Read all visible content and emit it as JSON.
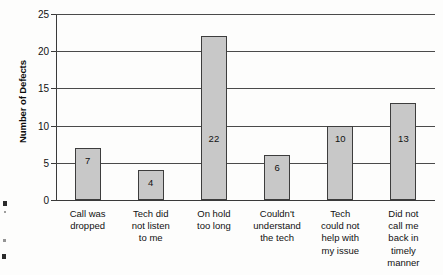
{
  "chart_data": {
    "type": "bar",
    "title": "",
    "subtitle": "",
    "xlabel": "",
    "ylabel": "Number of Defects",
    "ylim": [
      0,
      25
    ],
    "ytick_step": 5,
    "yticks": [
      "0",
      "5",
      "10",
      "15",
      "20",
      "25"
    ],
    "grid": true,
    "legend": false,
    "categories": [
      "Call was dropped",
      "Tech did not listen to me",
      "On hold too long",
      "Couldn't understand the tech",
      "Tech could not help with my issue",
      "Did not call me back in timely manner"
    ],
    "category_lines": [
      [
        "Call was",
        "dropped"
      ],
      [
        "Tech did",
        "not listen",
        "to me"
      ],
      [
        "On hold",
        "too long"
      ],
      [
        "Couldn't",
        "understand",
        "the tech"
      ],
      [
        "Tech",
        "could not",
        "help with",
        "my issue"
      ],
      [
        "Did not",
        "call me",
        "back in",
        "timely",
        "manner"
      ]
    ],
    "values": [
      7,
      4,
      22,
      6,
      10,
      13
    ],
    "value_labels": [
      "7",
      "4",
      "22",
      "6",
      "10",
      "13"
    ],
    "bar_fill_color": "#c8c8c8",
    "bar_border_color": "#3d3d3d",
    "gridline_color": "#4a4a4a",
    "axis_color": "#3a3a3a",
    "text_color": "#111111",
    "background_color": "#fdfdfc"
  }
}
